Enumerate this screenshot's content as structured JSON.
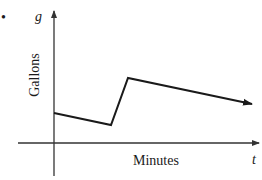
{
  "chart_data": {
    "type": "line",
    "title": "",
    "xlabel": "Minutes",
    "ylabel": "Gallons",
    "x_symbol": "t",
    "y_symbol": "g",
    "bullet": "•",
    "grid": false,
    "legend": null,
    "series": [
      {
        "name": "g(t)",
        "points": [
          {
            "x": 0,
            "y": 30
          },
          {
            "x": 57,
            "y": 18
          },
          {
            "x": 74,
            "y": 65
          },
          {
            "x": 198,
            "y": 39
          }
        ],
        "end_arrow": true
      }
    ]
  },
  "labels": {
    "bullet": "•",
    "y_symbol": "g",
    "y_axis_title": "Gallons",
    "x_axis_title": "Minutes",
    "x_symbol": "t"
  },
  "colors": {
    "line": "#1a1a1a",
    "axis": "#333333",
    "background": "#ffffff"
  }
}
